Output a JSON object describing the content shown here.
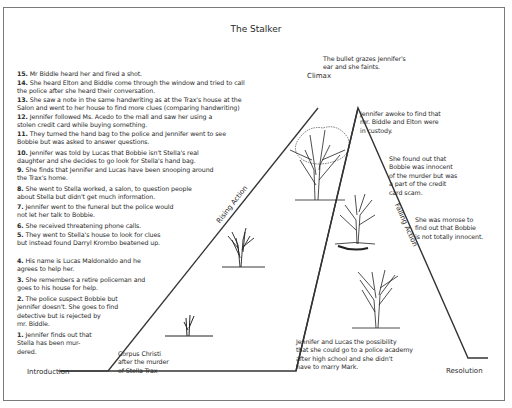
{
  "title": "The Stalker",
  "stages": {
    "introduction": "Introduction",
    "rising_action": "Rising Action",
    "climax": "Climax",
    "falling_action": "Falling Action",
    "resolution": "Resolution"
  },
  "rising_events": [
    {
      "num": "15.",
      "text": "Mr Biddle heard her and fired a shot."
    },
    {
      "num": "14.",
      "text": "She heard Elton and Biddle come through the window and tried to call\nthe police after she heard their conversation."
    },
    {
      "num": "13.",
      "text": "She saw a note in the same handwriting as at the Trax's house at the\nSalon and went to her house to find more clues (comparing handwriting)"
    },
    {
      "num": "12.",
      "text": "Jennifer followed Ms. Acedo to the mall and saw her using a\nstolen credit card while buying something."
    },
    {
      "num": "11.",
      "text": "They turned the hand bag to the police and Jennifer went to see\nBobbie but was asked to answer questions."
    },
    {
      "num": "10.",
      "text": "Jennifer was told by Lucas that Bobbie isn't Stella's real\ndaughter and she decides to go look for Stella's hand bag."
    },
    {
      "num": "9.",
      "text": "She finds that Jennifer and Lucas have been snooping around\nthe Trax's home."
    },
    {
      "num": "8.",
      "text": "She went to Stella worked, a salon, to question people\nabout Stella but didn't get much information."
    },
    {
      "num": "7.",
      "text": "Jennifer went to the funeral but the police would\nnot let her talk to Bobbie."
    },
    {
      "num": "6.",
      "text": "She received threatening phone calls."
    },
    {
      "num": "5.",
      "text": "They went to Stella's house to look for clues\nbut instead found Darryl Krombo beatened up."
    },
    {
      "num": "4.",
      "text": "His name is Lucas Maldonaldo and he\nagrees to help her."
    },
    {
      "num": "3.",
      "text": "She remembers a retire policeman and\ngoes to his house for help."
    },
    {
      "num": "2.",
      "text": "The police suspect Bobbie but\nJennifer doesn't. She goes to find\ndetective but is rejected by\nmr. Biddle."
    },
    {
      "num": "1.",
      "text": "Jennifer finds out that\nStella has been mur-\ndered."
    }
  ],
  "climax_text": "The bullet grazes Jennifer's\near and she faints.",
  "setting_text": "Corpus Christi\nafter the murder\nof Stella Trax",
  "falling_events": [
    "Jennifer awoke to find that\nmr. Biddle and Elton were\nin custody.",
    "She found out that\nBobbie was innocent\nof the murder but was\na part of the credit\ncard scam.",
    "She was morose to\nfind out that Bobbie\nis not totally innocent."
  ],
  "resolution_text": "Jennifer and Lucas the possibility\nthat she could go to a police academy\nafter high school and she didn't\nhave to marry Mark.",
  "trees": [
    {
      "name": "sprout-tree",
      "stage": "introduction"
    },
    {
      "name": "young-tree",
      "stage": "rising-action"
    },
    {
      "name": "full-tree",
      "stage": "climax"
    },
    {
      "name": "aging-tree",
      "stage": "falling-action"
    },
    {
      "name": "bare-tree",
      "stage": "resolution"
    }
  ]
}
